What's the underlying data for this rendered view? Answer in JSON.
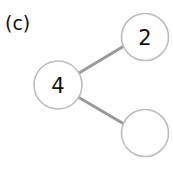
{
  "panel_label": "(c)",
  "tree": {
    "nodes": [
      {
        "id": "root",
        "label": "4"
      },
      {
        "id": "child-top",
        "label": "2"
      },
      {
        "id": "child-bottom",
        "label": ""
      }
    ],
    "edges": [
      {
        "from": "root",
        "to": "child-top"
      },
      {
        "from": "root",
        "to": "child-bottom"
      }
    ]
  },
  "colors": {
    "node_stroke": "#bdbdbd",
    "edge": "#9a9a9a",
    "text": "#111111",
    "background": "#ffffff"
  }
}
